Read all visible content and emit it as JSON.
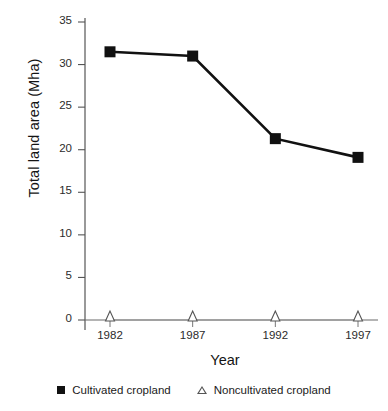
{
  "chart_data": {
    "type": "line",
    "title": "",
    "xlabel": "Year",
    "ylabel": "Total land area (Mha)",
    "categories": [
      "1982",
      "1987",
      "1992",
      "1997"
    ],
    "x": [
      1982,
      1987,
      1992,
      1997
    ],
    "series": [
      {
        "name": "Cultivated cropland",
        "marker": "filled-square",
        "color": "#111111",
        "values": [
          31.5,
          31.0,
          21.3,
          19.1
        ]
      },
      {
        "name": "Noncultivated cropland",
        "marker": "open-triangle",
        "color": "#555555",
        "values": [
          0,
          0,
          0,
          0
        ]
      }
    ],
    "ylim": [
      0,
      35
    ],
    "yticks": [
      0,
      5,
      10,
      15,
      20,
      25,
      30,
      35
    ],
    "ytick_labels": [
      "0",
      "5",
      "10",
      "15",
      "20",
      "25",
      "30",
      "35"
    ],
    "xtick_labels": [
      "1982",
      "1987",
      "1992",
      "1997"
    ],
    "grid": false,
    "legend_position": "bottom-center"
  },
  "axes": {
    "y_title": "Total land area (Mha)",
    "x_title": "Year"
  },
  "legend": {
    "items": [
      {
        "label": "Cultivated cropland",
        "icon": "filled-square-marker"
      },
      {
        "label": "Noncultivated cropland",
        "icon": "open-triangle-marker"
      }
    ]
  },
  "colors": {
    "line": "#111111",
    "secondary_line": "#6b6b6b",
    "axis": "#555555",
    "text": "#1a1a1a",
    "background": "#ffffff"
  }
}
